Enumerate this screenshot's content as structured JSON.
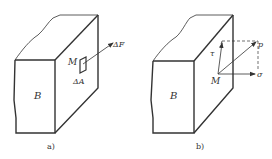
{
  "figure_a": {
    "caption": "a)",
    "body_label": "B",
    "point_label": "M",
    "area_label": "ΔA",
    "force_label": "ΔF"
  },
  "figure_b": {
    "caption": "b)",
    "body_label": "B",
    "point_label": "M",
    "total_stress_label": "p",
    "normal_stress_label": "σ",
    "shear_stress_label": "τ"
  },
  "colors": {
    "line": "#333333",
    "background": "#ffffff"
  }
}
